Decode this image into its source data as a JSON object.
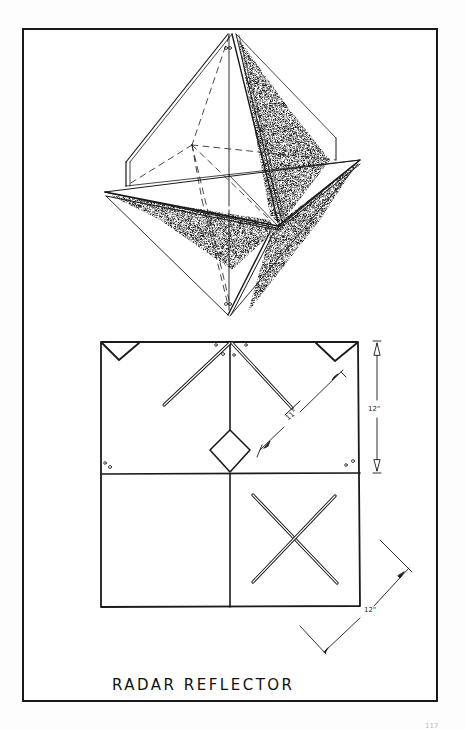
{
  "title": "RADAR REFLECTOR",
  "dimensions": {
    "height_label": "12\"",
    "diagonal_label": "11\"",
    "side_label": "12\""
  },
  "page_number": "117",
  "views": {
    "top": "assembled octahedral reflector (isometric view)",
    "bottom": "flat panel layout with slots and diagonal struts"
  }
}
